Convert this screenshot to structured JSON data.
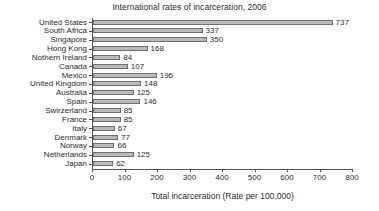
{
  "chart_data": {
    "type": "bar",
    "orientation": "horizontal",
    "title": "International rates of incarceration, 2006",
    "xlabel": "Total incarceration (Rate per 100,000)",
    "ylabel": "",
    "xlim": [
      0,
      800
    ],
    "xticks": [
      0,
      100,
      200,
      300,
      400,
      500,
      600,
      700,
      800
    ],
    "xtick_labels": [
      "0",
      "100",
      "200",
      "300",
      "400",
      "500",
      "600",
      "700",
      "800"
    ],
    "grid": false,
    "legend": null,
    "categories": [
      "United States",
      "South Africa",
      "Singapore",
      "Hong Kong",
      "Nothern Ireland",
      "Canada",
      "Mexico",
      "United Kingdom",
      "Australia",
      "Spain",
      "Swirzerland",
      "France",
      "Italy",
      "Denmark",
      "Norway",
      "Netherlands",
      "Japan"
    ],
    "values": [
      737,
      337,
      350,
      168,
      84,
      107,
      196,
      148,
      125,
      146,
      85,
      85,
      67,
      77,
      66,
      125,
      62
    ],
    "data_labels": [
      "737",
      "337",
      "350",
      "168",
      "84",
      "107",
      "196",
      "148",
      "125",
      "146",
      "85",
      "85",
      "67",
      "77",
      "66",
      "125",
      "62"
    ],
    "bar_fill_color": "#b9b9b9",
    "bar_edge_color": "#6e6e6e",
    "axis_color": "#555555",
    "text_color": "#2b2b2b",
    "background_color": "#ffffff"
  }
}
